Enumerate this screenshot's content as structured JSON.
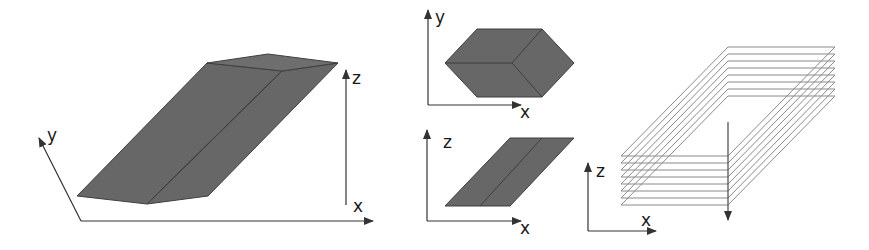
{
  "figure": {
    "colors": {
      "solid_fill": "#676767",
      "solid_edge": "#3f3f3f",
      "axis": "#333333",
      "layer_line": "#8a8a8a",
      "arrow": "#555555"
    },
    "panel_3d": {
      "axes": {
        "x_label": "x",
        "y_label": "y",
        "z_label": "z"
      }
    },
    "panel_top_view": {
      "axes": {
        "x_label": "x",
        "y_label": "y"
      }
    },
    "panel_side_view": {
      "axes": {
        "x_label": "x",
        "z_label": "z"
      }
    },
    "panel_layers": {
      "axes": {
        "x_label": "x",
        "z_label": "z"
      },
      "layer_count": 8
    }
  }
}
